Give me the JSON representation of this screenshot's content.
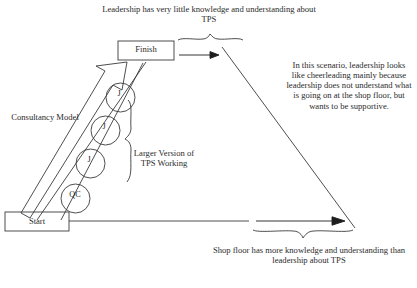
{
  "diagram": {
    "title_top": "Leadership has very little knowledge and understanding about TPS",
    "caption_right": "In this scenario, leadership looks like cheerleading mainly because leadership does not understand what is going on at the shop floor, but wants to be supportive.",
    "caption_bottom": "Shop floor has more knowledge and understanding than leadership about TPS",
    "label_consultancy": "Consultancy Model",
    "label_larger": "Larger Version of TPS Working",
    "boxes": {
      "start": "Start",
      "finish": "Finish"
    },
    "nodes": [
      {
        "label": "J"
      },
      {
        "label": "J"
      },
      {
        "label": "J"
      },
      {
        "label": "QC"
      }
    ],
    "colors": {
      "stroke": "#3a3a3a",
      "text": "#2b2b2b",
      "background": "#ffffff"
    }
  }
}
